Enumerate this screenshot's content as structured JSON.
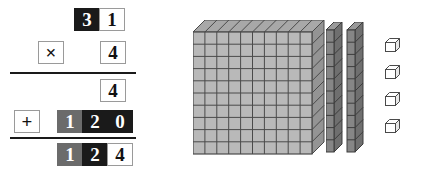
{
  "problem": {
    "type": "vertical-multiplication",
    "multiplicand": "31",
    "multiplier": "4",
    "operator_multiply": "×",
    "operator_add": "+",
    "partial_product_ones": "4",
    "partial_product_tens": "120",
    "product": "124"
  },
  "rows": {
    "multiplicand": {
      "label": "multiplicand-row",
      "digits": [
        {
          "value": "3",
          "place": "tens"
        },
        {
          "value": "1",
          "place": "ones"
        }
      ]
    },
    "multiplier": {
      "label": "multiplier-row",
      "operator": "×",
      "digits": [
        {
          "value": "4",
          "place": "ones"
        }
      ]
    },
    "partial_one": {
      "label": "partial-product-ones-row",
      "digits": [
        {
          "value": "4",
          "place": "ones"
        }
      ]
    },
    "partial_two": {
      "label": "partial-product-tens-row",
      "operator": "+",
      "digits": [
        {
          "value": "1",
          "place": "hundreds"
        },
        {
          "value": "2",
          "place": "tens"
        },
        {
          "value": "0",
          "place": "ones"
        }
      ]
    },
    "answer": {
      "label": "product-row",
      "digits": [
        {
          "value": "1",
          "place": "hundreds"
        },
        {
          "value": "2",
          "place": "tens"
        },
        {
          "value": "4",
          "place": "ones"
        }
      ]
    }
  },
  "manipulatives": {
    "label": "base-ten-blocks",
    "hundreds_flat": {
      "count": 1,
      "rows": 10,
      "cols": 10,
      "name": "hundred-flat"
    },
    "tens_rods": {
      "count": 2,
      "segments": 10,
      "name": "ten-rod"
    },
    "ones_cubes": {
      "count": 4,
      "name": "unit-cube"
    },
    "total_represented": "124"
  },
  "colors": {
    "ones": "#ffffff",
    "tens": "#1a1a1a",
    "hundreds": "#6b6b6b",
    "cell_border": "#9a9a9a",
    "rule": "#1a1a1a",
    "flat_fill": "#b9b9b9",
    "flat_line": "#4a4a4a",
    "rod_fill": "#868686",
    "rod_line": "#3d3d3d",
    "cube_fill": "#ffffff",
    "cube_line": "#4a4a4a"
  }
}
